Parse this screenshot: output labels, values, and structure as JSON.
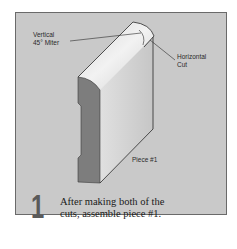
{
  "diagram": {
    "callouts": {
      "vertical_miter": [
        "Vertical",
        "45° Miter"
      ],
      "horizontal_cut": [
        "Horizontal",
        "Cut"
      ],
      "piece": "Piece #1"
    },
    "step": {
      "number": "1",
      "text_line1": "After making both of the",
      "text_line2": "cuts, assemble piece #1."
    },
    "colors": {
      "panel_bg": "#c9c9c9",
      "molding_face": "#d8d8d8",
      "molding_profile": "#7d7d7d",
      "molding_top": "#eeeeee",
      "step_number": "#5a5a5a"
    }
  }
}
